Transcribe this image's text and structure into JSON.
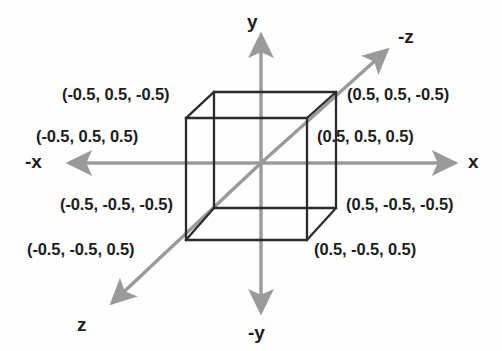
{
  "figure": {
    "background_color": "#fefefe",
    "axis_color": "#9a9a9a",
    "cube_edge_color": "#2b2b2b",
    "text_color": "#1d1d1d"
  },
  "axes": [
    {
      "name": "y-axis",
      "label": "y",
      "direction": "up"
    },
    {
      "name": "minus-y-axis",
      "label": "-y",
      "direction": "down"
    },
    {
      "name": "x-axis",
      "label": "x",
      "direction": "right"
    },
    {
      "name": "minus-x-axis",
      "label": "-x",
      "direction": "left"
    },
    {
      "name": "minus-z-axis",
      "label": "-z",
      "direction": "up-right"
    },
    {
      "name": "z-axis",
      "label": "z",
      "direction": "down-left"
    }
  ],
  "vertex_labels": [
    {
      "name": "back-top-left",
      "text": "(-0.5, 0.5, -0.5)"
    },
    {
      "name": "front-top-left",
      "text": "(-0.5, 0.5, 0.5)"
    },
    {
      "name": "back-top-right",
      "text": "(0.5, 0.5, -0.5)"
    },
    {
      "name": "front-top-right",
      "text": "(0.5, 0.5, 0.5)"
    },
    {
      "name": "back-bottom-left",
      "text": "(-0.5, -0.5, -0.5)"
    },
    {
      "name": "front-bottom-left",
      "text": "(-0.5, -0.5, 0.5)"
    },
    {
      "name": "back-bottom-right",
      "text": "(0.5, -0.5, -0.5)"
    },
    {
      "name": "front-bottom-right",
      "text": "(0.5, -0.5, 0.5)"
    }
  ]
}
